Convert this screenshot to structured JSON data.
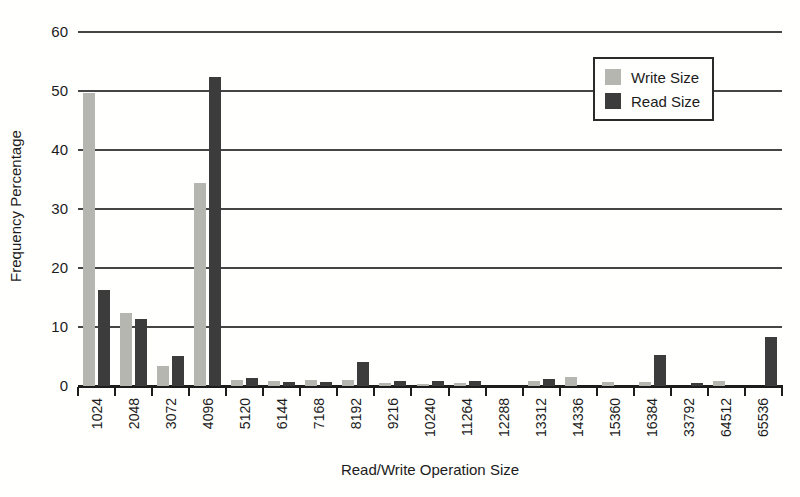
{
  "chart_data": {
    "type": "bar",
    "title": "",
    "xlabel": "Read/Write Operation Size",
    "ylabel": "Frequency Percentage",
    "ylim": [
      0,
      60
    ],
    "yticks": [
      0,
      10,
      20,
      30,
      40,
      50,
      60
    ],
    "grid": true,
    "legend_position": "top-right",
    "categories": [
      "1024",
      "2048",
      "3072",
      "4096",
      "5120",
      "6144",
      "7168",
      "8192",
      "9216",
      "10240",
      "11264",
      "12288",
      "13312",
      "14336",
      "15360",
      "16384",
      "33792",
      "64512",
      "65536"
    ],
    "series": [
      {
        "name": "Write Size",
        "color": "#b6b6b0",
        "values": [
          49.6,
          12.3,
          3.4,
          34.4,
          1.1,
          0.9,
          1.1,
          1.0,
          0.5,
          0.3,
          0.5,
          0,
          0.9,
          1.6,
          0.6,
          0.7,
          0,
          0.8,
          0
        ]
      },
      {
        "name": "Read Size",
        "color": "#3c3c3c",
        "values": [
          16.2,
          11.4,
          5.1,
          52.3,
          1.3,
          0.6,
          0.6,
          4.1,
          0.8,
          0.9,
          0.8,
          0,
          1.2,
          0,
          0,
          5.3,
          0.5,
          0,
          8.3
        ]
      }
    ]
  }
}
